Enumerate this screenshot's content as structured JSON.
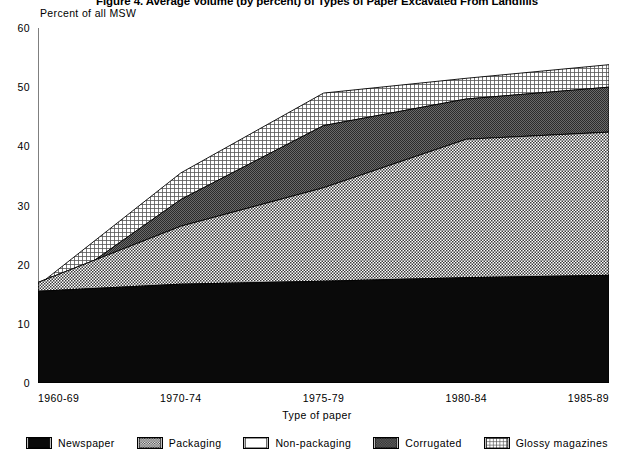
{
  "chart_data": {
    "type": "area",
    "title": "Figure 4. Average Volume (by percent) of Types of Paper Excavated From Landfills",
    "ylabel": "Percent of all MSW",
    "xlabel": "Type of paper",
    "categories": [
      "1960-69",
      "1970-74",
      "1975-79",
      "1980-84",
      "1985-89"
    ],
    "ylim": [
      0,
      60
    ],
    "yticks": [
      0,
      10,
      20,
      30,
      40,
      50,
      60
    ],
    "grid": false,
    "stacked": true,
    "legend_position": "bottom",
    "series": [
      {
        "name": "Newspaper",
        "pattern": "solid-black",
        "values": [
          15.5,
          17.0,
          11.8,
          14.0,
          16.5
        ]
      },
      {
        "name": "Packaging",
        "pattern": "stipple-mid",
        "values": [
          1.2,
          9.5,
          12.4,
          17.0,
          19.0
        ]
      },
      {
        "name": "Non-packaging",
        "pattern": "blank-white",
        "values": [
          0.5,
          6.5,
          8.3,
          12.5,
          13.5
        ]
      },
      {
        "name": "Corrugated",
        "pattern": "stipple-dark",
        "values": [
          0.6,
          8.2,
          8.0,
          4.5,
          2.5
        ]
      },
      {
        "name": "Glossy magazines",
        "pattern": "fine-grid",
        "values": [
          0.4,
          1.2,
          1.1,
          2.0,
          2.3
        ]
      }
    ],
    "cumulative_tops": [
      [
        15.5,
        16.7,
        17.2,
        17.8,
        18.2
      ],
      [
        17.0,
        26.5,
        33.0,
        41.2,
        42.4
      ],
      [
        11.8,
        24.2,
        32.5,
        40.5,
        41.6
      ],
      [
        14.0,
        31.0,
        43.5,
        48.0,
        50.0
      ],
      [
        16.5,
        35.5,
        49.0,
        51.5,
        53.8
      ]
    ]
  },
  "legend": {
    "items": [
      {
        "label": "Newspaper"
      },
      {
        "label": "Packaging"
      },
      {
        "label": "Non-packaging"
      },
      {
        "label": "Corrugated"
      },
      {
        "label": "Glossy magazines"
      }
    ]
  }
}
